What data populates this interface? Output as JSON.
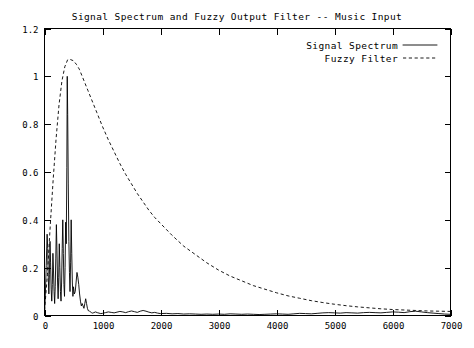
{
  "chart_data": {
    "type": "line",
    "title": "Signal Spectrum and Fuzzy Output Filter -- Music Input",
    "xlabel": "",
    "ylabel": "",
    "xlim": [
      0,
      7000
    ],
    "ylim": [
      0,
      1.2
    ],
    "grid": false,
    "legend_position": "top-right",
    "xticks": [
      0,
      1000,
      2000,
      3000,
      4000,
      5000,
      6000,
      7000
    ],
    "xtick_labels": [
      "0",
      "1000",
      "2000",
      "3000",
      "4000",
      "5000",
      "6000",
      "7000"
    ],
    "yticks": [
      0,
      0.2,
      0.4,
      0.6,
      0.8,
      1,
      1.2
    ],
    "ytick_labels": [
      "0",
      "0.2",
      "0.4",
      "0.6",
      "0.8",
      "1",
      "1.2"
    ],
    "series": [
      {
        "name": "Signal Spectrum",
        "style": "solid",
        "color": "#000000",
        "x": [
          0,
          15,
          30,
          45,
          55,
          65,
          75,
          85,
          95,
          105,
          115,
          125,
          135,
          145,
          155,
          165,
          175,
          185,
          195,
          205,
          215,
          225,
          235,
          245,
          255,
          265,
          275,
          285,
          295,
          305,
          315,
          325,
          335,
          345,
          355,
          365,
          375,
          385,
          392,
          400,
          410,
          420,
          430,
          440,
          450,
          460,
          470,
          480,
          490,
          500,
          515,
          530,
          545,
          560,
          575,
          590,
          605,
          620,
          635,
          650,
          665,
          680,
          695,
          710,
          725,
          740,
          755,
          770,
          790,
          810,
          830,
          850,
          880,
          910,
          940,
          970,
          1000,
          1050,
          1100,
          1150,
          1200,
          1250,
          1300,
          1350,
          1400,
          1450,
          1500,
          1550,
          1600,
          1650,
          1700,
          1750,
          1800,
          1850,
          1900,
          1950,
          2000,
          2100,
          2200,
          2300,
          2400,
          2500,
          2600,
          2700,
          2800,
          2900,
          3000,
          3100,
          3200,
          3300,
          3400,
          3500,
          3600,
          3700,
          3800,
          3900,
          4000,
          4100,
          4200,
          4300,
          4400,
          4500,
          4600,
          4700,
          4800,
          4900,
          5000,
          5100,
          5200,
          5300,
          5400,
          5500,
          5600,
          5700,
          5800,
          5900,
          6000,
          6100,
          6200,
          6300,
          6400,
          6500,
          6600,
          6700,
          6800,
          6900,
          7000
        ],
        "y": [
          0.0,
          0.09,
          0.21,
          0.34,
          0.28,
          0.16,
          0.09,
          0.17,
          0.31,
          0.22,
          0.11,
          0.06,
          0.13,
          0.26,
          0.19,
          0.1,
          0.05,
          0.12,
          0.24,
          0.38,
          0.27,
          0.14,
          0.07,
          0.16,
          0.3,
          0.2,
          0.1,
          0.06,
          0.14,
          0.28,
          0.4,
          0.26,
          0.13,
          0.08,
          0.2,
          0.39,
          0.3,
          0.62,
          1.0,
          0.84,
          0.55,
          0.31,
          0.18,
          0.1,
          0.22,
          0.4,
          0.26,
          0.14,
          0.08,
          0.12,
          0.09,
          0.1,
          0.14,
          0.18,
          0.16,
          0.13,
          0.09,
          0.06,
          0.04,
          0.05,
          0.04,
          0.03,
          0.05,
          0.07,
          0.05,
          0.03,
          0.02,
          0.02,
          0.015,
          0.012,
          0.01,
          0.012,
          0.015,
          0.012,
          0.01,
          0.008,
          0.009,
          0.012,
          0.015,
          0.013,
          0.011,
          0.014,
          0.017,
          0.015,
          0.012,
          0.016,
          0.019,
          0.016,
          0.013,
          0.018,
          0.021,
          0.018,
          0.014,
          0.011,
          0.013,
          0.01,
          0.008,
          0.009,
          0.007,
          0.008,
          0.006,
          0.007,
          0.006,
          0.005,
          0.006,
          0.005,
          0.006,
          0.005,
          0.007,
          0.006,
          0.005,
          0.006,
          0.005,
          0.004,
          0.005,
          0.006,
          0.007,
          0.006,
          0.005,
          0.007,
          0.009,
          0.008,
          0.007,
          0.009,
          0.011,
          0.012,
          0.011,
          0.01,
          0.012,
          0.011,
          0.01,
          0.012,
          0.013,
          0.012,
          0.011,
          0.013,
          0.015,
          0.014,
          0.012,
          0.016,
          0.018,
          0.015,
          0.012,
          0.01,
          0.008,
          0.006,
          0.005
        ]
      },
      {
        "name": "Fuzzy Filter",
        "style": "dashed",
        "color": "#000000",
        "x": [
          0,
          50,
          100,
          150,
          200,
          250,
          300,
          350,
          400,
          450,
          500,
          550,
          600,
          650,
          700,
          750,
          800,
          900,
          1000,
          1100,
          1200,
          1300,
          1400,
          1500,
          1600,
          1700,
          1800,
          1900,
          2000,
          2200,
          2400,
          2600,
          2800,
          3000,
          3200,
          3400,
          3600,
          3800,
          4000,
          4200,
          4400,
          4600,
          4800,
          5000,
          5200,
          5400,
          5600,
          5800,
          6000,
          6200,
          6400,
          6600,
          6800,
          7000
        ],
        "y": [
          0.02,
          0.17,
          0.38,
          0.57,
          0.74,
          0.88,
          0.98,
          1.04,
          1.07,
          1.07,
          1.065,
          1.05,
          1.03,
          1.0,
          0.97,
          0.94,
          0.91,
          0.85,
          0.79,
          0.735,
          0.685,
          0.635,
          0.59,
          0.55,
          0.51,
          0.475,
          0.44,
          0.41,
          0.385,
          0.335,
          0.29,
          0.255,
          0.22,
          0.19,
          0.165,
          0.145,
          0.125,
          0.11,
          0.095,
          0.082,
          0.072,
          0.062,
          0.054,
          0.047,
          0.041,
          0.036,
          0.032,
          0.028,
          0.025,
          0.023,
          0.021,
          0.019,
          0.018,
          0.017
        ]
      }
    ]
  },
  "legend": {
    "entries": [
      {
        "label": "Signal Spectrum",
        "style": "solid"
      },
      {
        "label": "Fuzzy Filter",
        "style": "dashed"
      }
    ]
  }
}
